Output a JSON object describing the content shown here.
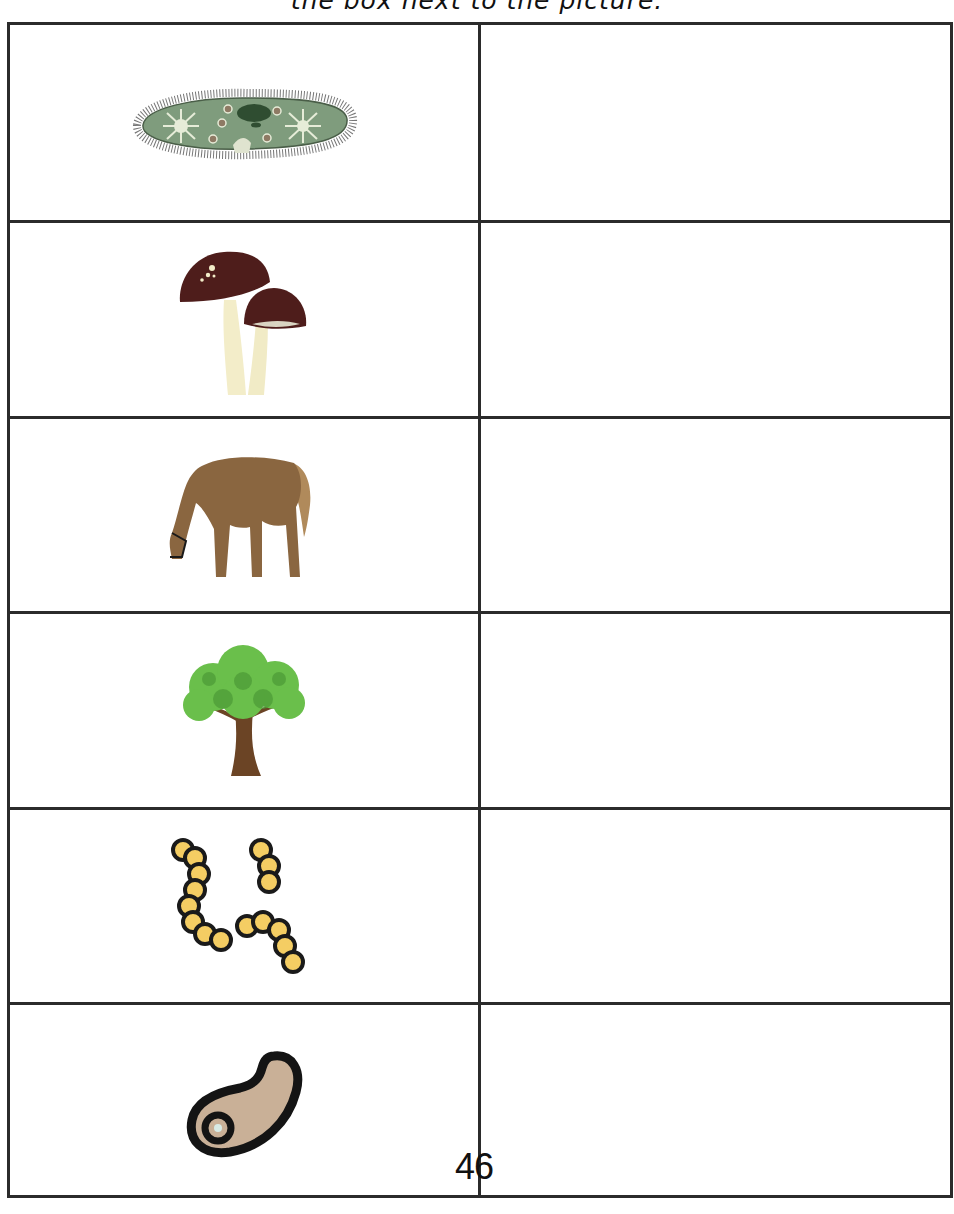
{
  "instruction": "the box next to the picture.",
  "page_number": "46",
  "rows": [
    {
      "picture": "paramecium-icon",
      "label": "paramecium",
      "answer": ""
    },
    {
      "picture": "mushroom-icon",
      "label": "mushrooms",
      "answer": ""
    },
    {
      "picture": "horse-icon",
      "label": "horse",
      "answer": ""
    },
    {
      "picture": "tree-icon",
      "label": "tree",
      "answer": ""
    },
    {
      "picture": "bacteria-cocci-icon",
      "label": "bacteria chains",
      "answer": ""
    },
    {
      "picture": "cell-icon",
      "label": "single cell",
      "answer": ""
    }
  ],
  "colors": {
    "grid": "#2b2b2b",
    "paramecium_body": "#7f9c7d",
    "mushroom_cap": "#4e1d1b",
    "mushroom_stem": "#f3edc9",
    "horse": "#8a6640",
    "tree_leaves": "#6abf4b",
    "tree_trunk": "#6b4425",
    "bacteria_fill": "#f4cd63",
    "cell_fill": "#c9b097"
  }
}
